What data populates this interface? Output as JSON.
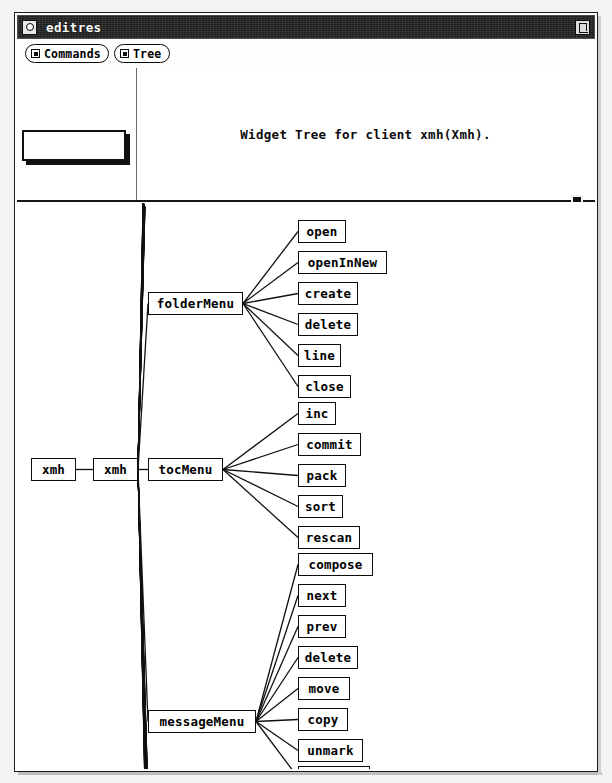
{
  "window": {
    "title": "editres",
    "menu_icon": "window-menu-icon",
    "resize_icon": "window-resize-icon"
  },
  "menubar": {
    "buttons": [
      {
        "label": "Commands",
        "icon": "menu-indicator-icon"
      },
      {
        "label": "Tree",
        "icon": "menu-indicator-icon"
      }
    ]
  },
  "top_pane": {
    "name_field_value": "",
    "heading": "Widget Tree for client xmh(Xmh)."
  },
  "tree": {
    "nodes": [
      {
        "id": "xmh-root",
        "label": "xmh",
        "x": 16,
        "y": 445,
        "w": 45
      },
      {
        "id": "xmh-shell",
        "label": "xmh",
        "x": 78,
        "y": 445,
        "w": 45
      },
      {
        "id": "folderMenu",
        "label": "folderMenu",
        "x": 133,
        "y": 279,
        "w": 95
      },
      {
        "id": "tocMenu",
        "label": "tocMenu",
        "x": 133,
        "y": 445,
        "w": 75
      },
      {
        "id": "messageMenu",
        "label": "messageMenu",
        "x": 133,
        "y": 697,
        "w": 108
      },
      {
        "id": "open",
        "label": "open",
        "x": 283,
        "y": 207,
        "w": 48
      },
      {
        "id": "openInNew",
        "label": "openInNew",
        "x": 283,
        "y": 238,
        "w": 89
      },
      {
        "id": "create",
        "label": "create",
        "x": 283,
        "y": 269,
        "w": 60
      },
      {
        "id": "delete1",
        "label": "delete",
        "x": 283,
        "y": 300,
        "w": 60
      },
      {
        "id": "line",
        "label": "line",
        "x": 283,
        "y": 331,
        "w": 43
      },
      {
        "id": "close",
        "label": "close",
        "x": 283,
        "y": 362,
        "w": 53
      },
      {
        "id": "inc",
        "label": "inc",
        "x": 283,
        "y": 389,
        "w": 38
      },
      {
        "id": "commit",
        "label": "commit",
        "x": 283,
        "y": 420,
        "w": 63
      },
      {
        "id": "pack",
        "label": "pack",
        "x": 283,
        "y": 451,
        "w": 48
      },
      {
        "id": "sort",
        "label": "sort",
        "x": 283,
        "y": 482,
        "w": 45
      },
      {
        "id": "rescan",
        "label": "rescan",
        "x": 283,
        "y": 513,
        "w": 62
      },
      {
        "id": "compose",
        "label": "compose",
        "x": 283,
        "y": 540,
        "w": 75
      },
      {
        "id": "next",
        "label": "next",
        "x": 283,
        "y": 571,
        "w": 48
      },
      {
        "id": "prev",
        "label": "prev",
        "x": 283,
        "y": 602,
        "w": 48
      },
      {
        "id": "delete2",
        "label": "delete",
        "x": 283,
        "y": 633,
        "w": 60
      },
      {
        "id": "move",
        "label": "move",
        "x": 283,
        "y": 664,
        "w": 52
      },
      {
        "id": "copy",
        "label": "copy",
        "x": 283,
        "y": 695,
        "w": 50
      },
      {
        "id": "unmark",
        "label": "unmark",
        "x": 283,
        "y": 726,
        "w": 65
      },
      {
        "id": "viewNew",
        "label": "viewNew",
        "x": 283,
        "y": 753,
        "w": 72
      }
    ],
    "edges": [
      {
        "from": "xmh-root",
        "to": "xmh-shell"
      },
      {
        "from": "xmh-shell",
        "to": "folderMenu"
      },
      {
        "from": "xmh-shell",
        "to": "tocMenu"
      },
      {
        "from": "xmh-shell",
        "to": "messageMenu"
      },
      {
        "from": "folderMenu",
        "to": "open"
      },
      {
        "from": "folderMenu",
        "to": "openInNew"
      },
      {
        "from": "folderMenu",
        "to": "create"
      },
      {
        "from": "folderMenu",
        "to": "delete1"
      },
      {
        "from": "folderMenu",
        "to": "line"
      },
      {
        "from": "folderMenu",
        "to": "close"
      },
      {
        "from": "tocMenu",
        "to": "inc"
      },
      {
        "from": "tocMenu",
        "to": "commit"
      },
      {
        "from": "tocMenu",
        "to": "pack"
      },
      {
        "from": "tocMenu",
        "to": "sort"
      },
      {
        "from": "tocMenu",
        "to": "rescan"
      },
      {
        "from": "messageMenu",
        "to": "compose"
      },
      {
        "from": "messageMenu",
        "to": "next"
      },
      {
        "from": "messageMenu",
        "to": "prev"
      },
      {
        "from": "messageMenu",
        "to": "delete2"
      },
      {
        "from": "messageMenu",
        "to": "move"
      },
      {
        "from": "messageMenu",
        "to": "copy"
      },
      {
        "from": "messageMenu",
        "to": "unmark"
      },
      {
        "from": "messageMenu",
        "to": "viewNew"
      }
    ],
    "hidden_fan_count": 40,
    "hidden_fan_note": "dense collapsed-edge bundle from xmh-shell"
  },
  "colors": {
    "titlebar_bg": "#1d1d1d",
    "titlebar_text": "#ffffff",
    "canvas_bg": "#ffffff",
    "line": "#111111",
    "frame": "#1b1b1b"
  }
}
